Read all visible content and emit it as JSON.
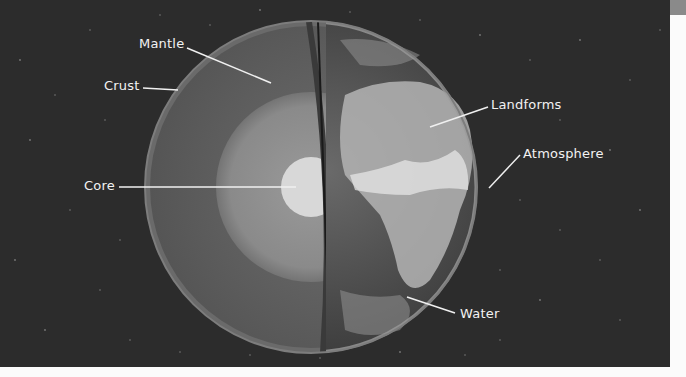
{
  "diagram": {
    "background_color": "#2c2c2c",
    "labels": [
      {
        "id": "mantle",
        "text": "Mantle"
      },
      {
        "id": "crust",
        "text": "Crust"
      },
      {
        "id": "core",
        "text": "Core"
      },
      {
        "id": "landforms",
        "text": "Landforms"
      },
      {
        "id": "atmosphere",
        "text": "Atmosphere"
      },
      {
        "id": "water",
        "text": "Water"
      }
    ]
  }
}
